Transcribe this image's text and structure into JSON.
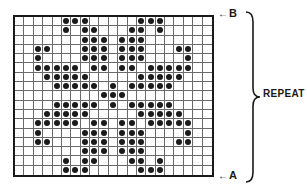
{
  "diagram": {
    "type": "knitting-chart",
    "columns": 21,
    "rows": 17,
    "stitch_symbol": "dot",
    "dot_color": "#1a1a1a",
    "grid_color": "#6a6a6a",
    "dots_by_row": [
      [
        5,
        6,
        7,
        13,
        14,
        15
      ],
      [
        5,
        7,
        8,
        12,
        13,
        15
      ],
      [
        7,
        8,
        9,
        11,
        12,
        13
      ],
      [
        2,
        3,
        7,
        8,
        9,
        11,
        12,
        13,
        17,
        18
      ],
      [
        2,
        7,
        8,
        9,
        11,
        12,
        13,
        18
      ],
      [
        2,
        3,
        4,
        5,
        6,
        8,
        9,
        11,
        12,
        14,
        15,
        16,
        17,
        18
      ],
      [
        3,
        4,
        5,
        6,
        7,
        13,
        14,
        15,
        16,
        17
      ],
      [
        4,
        5,
        6,
        7,
        8,
        10,
        12,
        13,
        14,
        15,
        16
      ],
      [
        9,
        10,
        11
      ],
      [
        4,
        5,
        6,
        7,
        8,
        10,
        12,
        13,
        14,
        15,
        16
      ],
      [
        3,
        4,
        5,
        6,
        7,
        13,
        14,
        15,
        16,
        17
      ],
      [
        2,
        3,
        4,
        5,
        6,
        8,
        9,
        11,
        12,
        14,
        15,
        16,
        17,
        18
      ],
      [
        2,
        7,
        8,
        9,
        11,
        12,
        13,
        18
      ],
      [
        2,
        3,
        7,
        8,
        9,
        11,
        12,
        13,
        17,
        18
      ],
      [
        7,
        8,
        9,
        11,
        12,
        13
      ],
      [
        5,
        7,
        8,
        12,
        13,
        15
      ],
      [
        5,
        6,
        7,
        13,
        14,
        15
      ]
    ]
  },
  "labels": {
    "top_marker": {
      "arrow": "←",
      "letter": "B"
    },
    "bottom_marker": {
      "arrow": "←",
      "letter": "A"
    },
    "repeat": "REPEAT"
  }
}
